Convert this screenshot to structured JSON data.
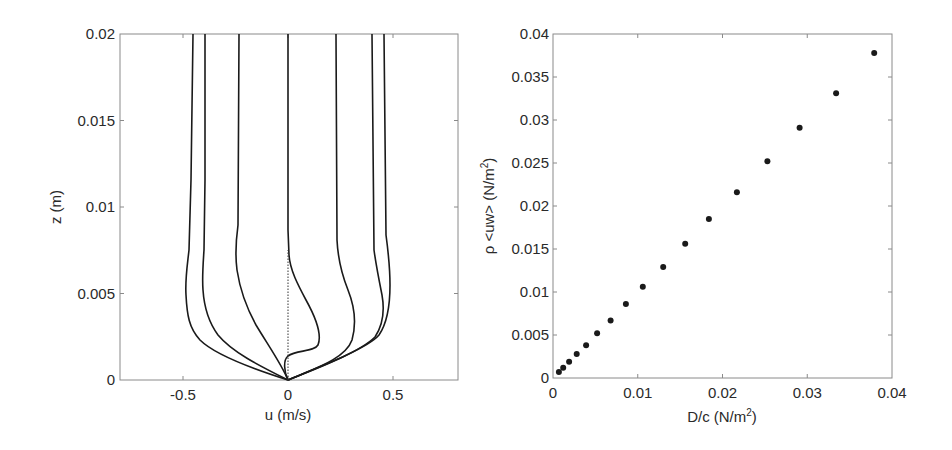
{
  "chart_data": [
    {
      "type": "line",
      "title": "",
      "xlabel": "u (m/s)",
      "ylabel": "z (m)",
      "xlim": [
        -0.8,
        0.8
      ],
      "ylim": [
        0,
        0.02
      ],
      "xticks": [
        -0.5,
        0,
        0.5
      ],
      "xtick_labels": [
        "-0.5",
        "0",
        "0.5"
      ],
      "yticks": [
        0,
        0.005,
        0.01,
        0.015,
        0.02
      ],
      "ytick_labels": [
        "0",
        "0.005",
        "0.01",
        "0.015",
        "0.02"
      ],
      "grid": false,
      "legend": null,
      "series": [
        {
          "name": "profile-1",
          "style": "solid",
          "z": [
            0,
            0.001,
            0.002,
            0.003,
            0.004,
            0.005,
            0.006,
            0.008,
            0.01,
            0.015,
            0.02
          ],
          "u": [
            0,
            -0.2,
            -0.35,
            -0.43,
            -0.47,
            -0.48,
            -0.48,
            -0.47,
            -0.46,
            -0.455,
            -0.45
          ]
        },
        {
          "name": "profile-2",
          "style": "solid",
          "z": [
            0,
            0.001,
            0.002,
            0.003,
            0.004,
            0.005,
            0.006,
            0.008,
            0.01,
            0.015,
            0.02
          ],
          "u": [
            0,
            -0.15,
            -0.27,
            -0.34,
            -0.38,
            -0.4,
            -0.41,
            -0.41,
            -0.4,
            -0.395,
            -0.39
          ]
        },
        {
          "name": "profile-3",
          "style": "solid",
          "z": [
            0,
            0.001,
            0.002,
            0.003,
            0.004,
            0.005,
            0.006,
            0.008,
            0.01,
            0.015,
            0.02
          ],
          "u": [
            0,
            -0.05,
            -0.12,
            -0.17,
            -0.21,
            -0.23,
            -0.245,
            -0.25,
            -0.24,
            -0.235,
            -0.23
          ]
        },
        {
          "name": "profile-4",
          "style": "solid",
          "z": [
            0,
            0.001,
            0.002,
            0.003,
            0.004,
            0.005,
            0.006,
            0.007,
            0.008,
            0.01,
            0.015,
            0.02
          ],
          "u": [
            0,
            0.13,
            0.15,
            0.13,
            0.1,
            0.07,
            0.03,
            0.005,
            0,
            0,
            0,
            0
          ]
        },
        {
          "name": "profile-5",
          "style": "solid",
          "z": [
            0,
            0.001,
            0.002,
            0.003,
            0.004,
            0.005,
            0.006,
            0.008,
            0.01,
            0.015,
            0.02
          ],
          "u": [
            0,
            0.2,
            0.3,
            0.32,
            0.3,
            0.27,
            0.25,
            0.23,
            0.225,
            0.225,
            0.225
          ]
        },
        {
          "name": "profile-6",
          "style": "solid",
          "z": [
            0,
            0.001,
            0.002,
            0.003,
            0.004,
            0.005,
            0.006,
            0.008,
            0.01,
            0.015,
            0.02
          ],
          "u": [
            0,
            0.25,
            0.38,
            0.43,
            0.45,
            0.44,
            0.42,
            0.4,
            0.395,
            0.395,
            0.395
          ]
        },
        {
          "name": "profile-7",
          "style": "solid",
          "z": [
            0,
            0.001,
            0.002,
            0.003,
            0.004,
            0.005,
            0.006,
            0.008,
            0.01,
            0.015,
            0.02
          ],
          "u": [
            0,
            0.23,
            0.36,
            0.43,
            0.47,
            0.48,
            0.48,
            0.47,
            0.46,
            0.455,
            0.455
          ]
        },
        {
          "name": "zero-reference",
          "style": "dotted",
          "z": [
            0,
            0.0075
          ],
          "u": [
            0,
            0
          ]
        }
      ]
    },
    {
      "type": "scatter",
      "title": "",
      "xlabel": "D/c (N/m²)",
      "ylabel": "ρ <uw> (N/m²)",
      "xlim": [
        0,
        0.04
      ],
      "ylim": [
        0,
        0.04
      ],
      "xticks": [
        0,
        0.01,
        0.02,
        0.03,
        0.04
      ],
      "xtick_labels": [
        "0",
        "0.01",
        "0.02",
        "0.03",
        "0.04"
      ],
      "yticks": [
        0,
        0.005,
        0.01,
        0.015,
        0.02,
        0.025,
        0.03,
        0.035,
        0.04
      ],
      "ytick_labels": [
        "0",
        "0.005",
        "0.01",
        "0.015",
        "0.02",
        "0.025",
        "0.03",
        "0.035",
        "0.04"
      ],
      "grid": false,
      "legend": null,
      "series": [
        {
          "name": "data",
          "marker": "filled-circle",
          "x": [
            0.0007,
            0.0012,
            0.0019,
            0.0028,
            0.0039,
            0.0052,
            0.0068,
            0.0086,
            0.0106,
            0.013,
            0.0156,
            0.0184,
            0.0217,
            0.0253,
            0.0291,
            0.0334,
            0.0379
          ],
          "y": [
            0.0007,
            0.0012,
            0.0019,
            0.0028,
            0.0038,
            0.0052,
            0.0067,
            0.0086,
            0.0106,
            0.0129,
            0.0156,
            0.0185,
            0.0216,
            0.0252,
            0.0291,
            0.0331,
            0.0378
          ]
        }
      ]
    }
  ],
  "left_chart": {
    "xlabel": "u (m/s)",
    "ylabel": "z (m)",
    "xtick_labels": [
      "-0.5",
      "0",
      "0.5"
    ],
    "ytick_labels": [
      "0",
      "0.005",
      "0.01",
      "0.015",
      "0.02"
    ]
  },
  "right_chart": {
    "xlabel_main": "D/c (N/m",
    "xlabel_sup": "2",
    "xlabel_end": ")",
    "ylabel_main": "ρ <uw> (N/m",
    "ylabel_sup": "2",
    "ylabel_end": ")",
    "xtick_labels": [
      "0",
      "0.01",
      "0.02",
      "0.03",
      "0.04"
    ],
    "ytick_labels": [
      "0",
      "0.005",
      "0.01",
      "0.015",
      "0.02",
      "0.025",
      "0.03",
      "0.035",
      "0.04"
    ]
  }
}
